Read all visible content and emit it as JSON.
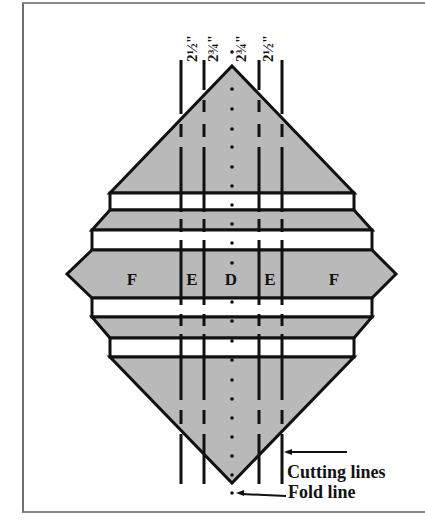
{
  "figure": {
    "measurements": [
      {
        "label": "2½\"",
        "x": 192
      },
      {
        "label": "2¾\"",
        "x": 213
      },
      {
        "label": "2¾\"",
        "x": 241
      },
      {
        "label": "2½\"",
        "x": 268
      }
    ],
    "strip_labels": [
      {
        "label": "F",
        "x": 132
      },
      {
        "label": "E",
        "x": 192
      },
      {
        "label": "D",
        "x": 231
      },
      {
        "label": "E",
        "x": 270
      },
      {
        "label": "F",
        "x": 334
      }
    ],
    "annotations": {
      "cutting_lines": "Cutting lines",
      "fold_line": "Fold line"
    },
    "colors": {
      "fill": "#b9b9b9",
      "stroke": "#111111",
      "strip": "#ffffff"
    }
  }
}
